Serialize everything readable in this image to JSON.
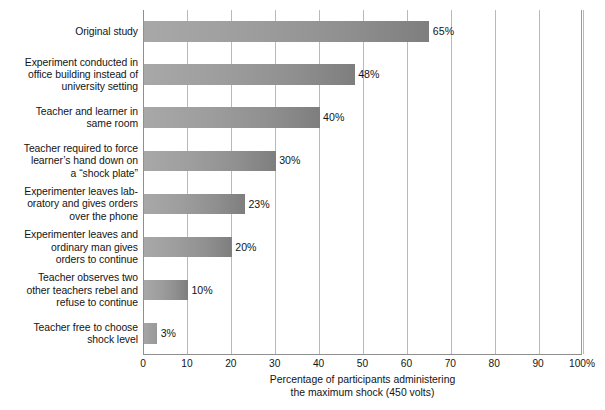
{
  "chart_data": {
    "type": "bar",
    "orientation": "horizontal",
    "title": "",
    "xlabel": "Percentage of participants administering the maximum shock (450 volts)",
    "xlabel_lines": [
      "Percentage of participants administering",
      "the maximum shock (450 volts)"
    ],
    "ylabel": "",
    "xlim": [
      0,
      100
    ],
    "xticks": [
      0,
      10,
      20,
      30,
      40,
      50,
      60,
      70,
      80,
      90,
      100
    ],
    "xtick_labels": [
      "0",
      "10",
      "20",
      "30",
      "40",
      "50",
      "60",
      "70",
      "80",
      "90",
      "100%"
    ],
    "grid": true,
    "grid_axis": "x",
    "legend": null,
    "categories": [
      "Original study",
      "Experiment conducted in office building instead of university setting",
      "Teacher and learner in same room",
      "Teacher required to force learner's hand down on a “shock plate”",
      "Experimenter leaves lab-oratory and gives orders over the phone",
      "Experimenter leaves and ordinary man gives orders to continue",
      "Teacher observes two other teachers rebel and refuse to continue",
      "Teacher free to choose shock level"
    ],
    "values": [
      65,
      48,
      40,
      30,
      23,
      20,
      10,
      3
    ],
    "value_labels": [
      "65%",
      "48%",
      "40%",
      "30%",
      "23%",
      "20%",
      "10%",
      "3%"
    ],
    "bars": [
      {
        "label_lines": [
          "Original study"
        ],
        "value": 65,
        "value_label": "65%"
      },
      {
        "label_lines": [
          "Experiment conducted in",
          "office building instead of",
          "university setting"
        ],
        "value": 48,
        "value_label": "48%"
      },
      {
        "label_lines": [
          "Teacher and learner in",
          "same room"
        ],
        "value": 40,
        "value_label": "40%"
      },
      {
        "label_lines": [
          "Teacher required to force",
          "learner’s hand down on",
          "a “shock plate”"
        ],
        "value": 30,
        "value_label": "30%"
      },
      {
        "label_lines": [
          "Experimenter leaves lab-",
          "oratory and gives orders",
          "over the phone"
        ],
        "value": 23,
        "value_label": "23%"
      },
      {
        "label_lines": [
          "Experimenter leaves and",
          "ordinary man gives",
          "orders to continue"
        ],
        "value": 20,
        "value_label": "20%"
      },
      {
        "label_lines": [
          "Teacher observes two",
          "other teachers rebel and",
          "refuse to continue"
        ],
        "value": 10,
        "value_label": "10%"
      },
      {
        "label_lines": [
          "Teacher free to choose",
          "shock level"
        ],
        "value": 3,
        "value_label": "3%"
      }
    ],
    "colors": {
      "bar_light": "#a8a8a8",
      "bar_dark": "#7e7e7e",
      "gridline": "#b9b9b9",
      "axis": "#8f8f8f",
      "text": "#141414",
      "background": "#ffffff"
    }
  }
}
